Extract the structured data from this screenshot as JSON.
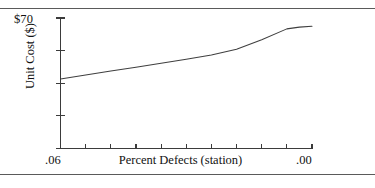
{
  "figure": {
    "background_color": "#ffffff",
    "line_color": "#3f3f3f",
    "axis_color": "#3b3b3b",
    "rule_color": "#5a5a5a",
    "top_rule_label": "top-horizontal-rule",
    "bottom_rule_label": "bottom-horizontal-rule"
  },
  "chart_data": {
    "type": "line",
    "title": "",
    "subtitle": "",
    "xlabel": "Percent Defects (station)",
    "ylabel": "Unit Cost ($)",
    "y_axis_top_label": "$70",
    "x_tick_labels": [
      ".06",
      ".00"
    ],
    "x_tick_label_left": ".06",
    "x_tick_label_right": ".00",
    "xlim": [
      0.06,
      0.0
    ],
    "ylim": [
      40,
      70
    ],
    "x_axis_direction": "decreasing",
    "grid": false,
    "legend": false,
    "legend_position": "none",
    "n_x_ticks": 11,
    "n_y_ticks": 5,
    "x": [
      0.06,
      0.054,
      0.048,
      0.042,
      0.036,
      0.03,
      0.024,
      0.018,
      0.012,
      0.006,
      0.003,
      0.0
    ],
    "y": [
      56.0,
      56.9,
      57.8,
      58.7,
      59.6,
      60.5,
      61.5,
      62.8,
      65.0,
      67.5,
      67.9,
      68.1
    ],
    "series": [
      {
        "name": "Unit Cost",
        "values": [
          56.0,
          56.9,
          57.8,
          58.7,
          59.6,
          60.5,
          61.5,
          62.8,
          65.0,
          67.5,
          67.9,
          68.1
        ]
      }
    ],
    "annotations": []
  }
}
